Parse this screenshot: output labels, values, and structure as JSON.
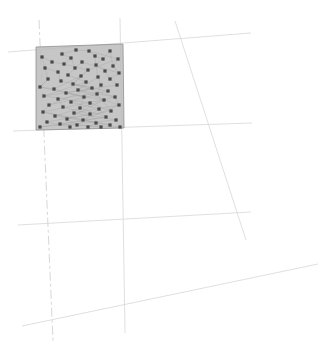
{
  "figure": {
    "title": "",
    "subtitle": "",
    "background_color": "#ffffff",
    "width": 323,
    "height": 357
  },
  "chart_data": {
    "type": "scatter",
    "title": "",
    "subtitle": "",
    "xlabel": "",
    "ylabel": "",
    "xlim": [
      0,
      323
    ],
    "ylim": [
      0,
      357
    ],
    "grid": true,
    "legend": null,
    "annotations": [],
    "tick_labels": {
      "x": [],
      "y": []
    },
    "colors": {
      "region_fill": "#b9b9b9",
      "region_stroke": "#8f8f8f",
      "marker": "#4a4a4a",
      "mesh_edge": "#9a9a9a",
      "guide_line": "#d9d9d9",
      "background": "#ffffff"
    },
    "region": {
      "name": "shaded-sample-domain",
      "shape": "quadrilateral",
      "vertices": [
        [
          36,
          47
        ],
        [
          123,
          44
        ],
        [
          124,
          128
        ],
        [
          36,
          130
        ]
      ]
    },
    "guide_lines": [
      {
        "name": "horizontal-upper",
        "x1": 8,
        "y1": 52,
        "x2": 251,
        "y2": 33,
        "style": "solid"
      },
      {
        "name": "horizontal-middle",
        "x1": 13,
        "y1": 131,
        "x2": 252,
        "y2": 123,
        "style": "solid"
      },
      {
        "name": "horizontal-lower",
        "x1": 18,
        "y1": 225,
        "x2": 251,
        "y2": 212,
        "style": "solid"
      },
      {
        "name": "diagonal-bottom",
        "x1": 22,
        "y1": 326,
        "x2": 318,
        "y2": 264,
        "style": "solid"
      },
      {
        "name": "diagonal-steep-right",
        "x1": 175,
        "y1": 21,
        "x2": 246,
        "y2": 240,
        "style": "solid"
      },
      {
        "name": "vertical-left",
        "x1": 39,
        "y1": 20,
        "x2": 53,
        "y2": 341,
        "style": "dashed"
      },
      {
        "name": "vertical-right",
        "x1": 120,
        "y1": 18,
        "x2": 125,
        "y2": 333,
        "style": "solid"
      }
    ],
    "points": [
      [
        76,
        50
      ],
      [
        89,
        51
      ],
      [
        110,
        51
      ],
      [
        62,
        54
      ],
      [
        95,
        56
      ],
      [
        42,
        57
      ],
      [
        71,
        58
      ],
      [
        103,
        59
      ],
      [
        118,
        59
      ],
      [
        52,
        62
      ],
      [
        82,
        62
      ],
      [
        64,
        64
      ],
      [
        96,
        65
      ],
      [
        113,
        66
      ],
      [
        45,
        68
      ],
      [
        75,
        68
      ],
      [
        88,
        70
      ],
      [
        105,
        71
      ],
      [
        58,
        72
      ],
      [
        119,
        73
      ],
      [
        68,
        75
      ],
      [
        81,
        76
      ],
      [
        98,
        77
      ],
      [
        48,
        79
      ],
      [
        110,
        79
      ],
      [
        61,
        81
      ],
      [
        86,
        82
      ],
      [
        73,
        84
      ],
      [
        101,
        85
      ],
      [
        117,
        85
      ],
      [
        40,
        87
      ],
      [
        92,
        88
      ],
      [
        54,
        89
      ],
      [
        78,
        90
      ],
      [
        108,
        91
      ],
      [
        66,
        93
      ],
      [
        97,
        94
      ],
      [
        44,
        96
      ],
      [
        84,
        97
      ],
      [
        115,
        97
      ],
      [
        58,
        99
      ],
      [
        104,
        100
      ],
      [
        71,
        102
      ],
      [
        90,
        103
      ],
      [
        49,
        105
      ],
      [
        119,
        105
      ],
      [
        63,
        107
      ],
      [
        80,
        108
      ],
      [
        99,
        109
      ],
      [
        111,
        111
      ],
      [
        43,
        112
      ],
      [
        74,
        113
      ],
      [
        90,
        114
      ],
      [
        55,
        116
      ],
      [
        106,
        117
      ],
      [
        67,
        119
      ],
      [
        83,
        120
      ],
      [
        116,
        120
      ],
      [
        47,
        122
      ],
      [
        96,
        123
      ],
      [
        60,
        124
      ],
      [
        77,
        125
      ],
      [
        110,
        125
      ],
      [
        40,
        127
      ],
      [
        70,
        127
      ],
      [
        88,
        127
      ],
      [
        101,
        127
      ],
      [
        120,
        127
      ]
    ],
    "mesh_edges": [
      [
        0,
        1
      ],
      [
        1,
        4
      ],
      [
        0,
        3
      ],
      [
        3,
        6
      ],
      [
        4,
        7
      ],
      [
        2,
        7
      ],
      [
        2,
        13
      ],
      [
        5,
        9
      ],
      [
        6,
        11
      ],
      [
        7,
        12
      ],
      [
        8,
        13
      ],
      [
        9,
        11
      ],
      [
        10,
        15
      ],
      [
        11,
        16
      ],
      [
        12,
        17
      ],
      [
        13,
        19
      ],
      [
        14,
        18
      ],
      [
        15,
        20
      ],
      [
        16,
        21
      ],
      [
        17,
        24
      ],
      [
        18,
        25
      ],
      [
        19,
        24
      ],
      [
        20,
        26
      ],
      [
        21,
        27
      ],
      [
        22,
        28
      ],
      [
        23,
        30
      ],
      [
        24,
        29
      ],
      [
        25,
        31
      ],
      [
        26,
        33
      ],
      [
        27,
        34
      ],
      [
        28,
        36
      ],
      [
        29,
        37
      ],
      [
        30,
        32
      ],
      [
        31,
        35
      ],
      [
        32,
        38
      ],
      [
        33,
        39
      ],
      [
        34,
        40
      ],
      [
        35,
        41
      ],
      [
        36,
        42
      ],
      [
        37,
        43
      ],
      [
        38,
        44
      ],
      [
        39,
        45
      ],
      [
        40,
        46
      ],
      [
        41,
        47
      ],
      [
        42,
        48
      ],
      [
        43,
        49
      ],
      [
        44,
        50
      ],
      [
        45,
        51
      ],
      [
        46,
        52
      ],
      [
        47,
        53
      ],
      [
        48,
        54
      ],
      [
        49,
        55
      ],
      [
        50,
        56
      ],
      [
        51,
        57
      ],
      [
        52,
        58
      ],
      [
        53,
        59
      ],
      [
        54,
        60
      ],
      [
        55,
        61
      ],
      [
        56,
        62
      ],
      [
        57,
        63
      ],
      [
        58,
        64
      ],
      [
        59,
        65
      ],
      [
        60,
        66
      ],
      [
        61,
        67
      ],
      [
        4,
        12
      ],
      [
        8,
        16
      ],
      [
        12,
        22
      ],
      [
        16,
        27
      ],
      [
        22,
        33
      ],
      [
        27,
        39
      ],
      [
        33,
        45
      ],
      [
        39,
        50
      ],
      [
        45,
        56
      ],
      [
        50,
        62
      ],
      [
        5,
        14
      ],
      [
        14,
        23
      ],
      [
        23,
        30
      ],
      [
        30,
        38
      ],
      [
        38,
        47
      ],
      [
        47,
        54
      ],
      [
        54,
        63
      ],
      [
        1,
        8
      ],
      [
        6,
        15
      ],
      [
        10,
        19
      ],
      [
        21,
        32
      ],
      [
        26,
        37
      ],
      [
        31,
        44
      ],
      [
        36,
        49
      ],
      [
        41,
        55
      ],
      [
        48,
        61
      ],
      [
        52,
        66
      ]
    ],
    "n_points": 68
  },
  "accessibility": {
    "description": "Faint line figure: a light gray shaded quadrilateral region in the upper left filled with scattered small square point markers joined by a sparse network of thin edges, overlaid on several very light near-vertical and near-horizontal guide lines that extend across the rest of the white canvas."
  }
}
